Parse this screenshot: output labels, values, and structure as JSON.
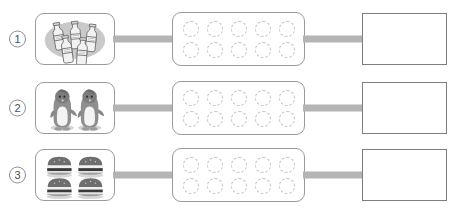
{
  "worksheet": {
    "title": "Counting worksheet: match objects to ten-frame and write the number",
    "colors": {
      "box_border": "#9a9a9a",
      "answer_border": "#7d7d7d",
      "connector": "#b4b4b4",
      "dashed_circle": "#c2c2c2",
      "number_text": "#4d4d4d",
      "page_background": "#ffffff"
    },
    "frame": {
      "rows": 2,
      "columns": 5,
      "total_circles": 10,
      "circle_style": "dashed",
      "filled_count": 0
    },
    "rows": [
      {
        "index_label": "1",
        "item_name": "milk-bottle",
        "item_count": 5,
        "item_arrangement": "3 in back row, 2 in front row",
        "answer_value": ""
      },
      {
        "index_label": "2",
        "item_name": "penguin",
        "item_count": 2,
        "item_arrangement": "2 side by side",
        "answer_value": ""
      },
      {
        "index_label": "3",
        "item_name": "hamburger",
        "item_count": 4,
        "item_arrangement": "2 by 2 grid",
        "answer_value": ""
      }
    ]
  }
}
